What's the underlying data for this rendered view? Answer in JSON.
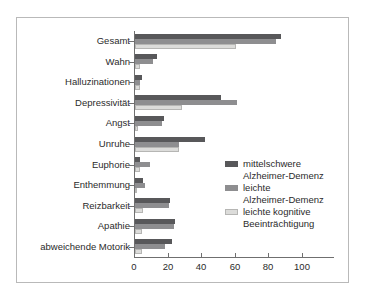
{
  "chart": {
    "type": "bar",
    "orientation": "horizontal",
    "title": "",
    "xlabel": "",
    "ylabel": "",
    "xlim": [
      0,
      118
    ],
    "xticks": [
      "0",
      "20",
      "40",
      "60",
      "80",
      "100"
    ],
    "xtick_values": [
      0,
      20,
      40,
      60,
      80,
      100
    ],
    "grid": false,
    "legend_position": "center-right",
    "colors": {
      "series_0": "#58585a",
      "series_1": "#8e8e90",
      "series_2": "#dcdcda",
      "axis": "#6f6f6f",
      "frame": "#b9b9b9",
      "text": "#2b2b2b",
      "background": "#ffffff"
    }
  },
  "chart_data": {
    "type": "bar",
    "orientation": "horizontal",
    "title": "",
    "xlabel": "",
    "ylabel": "",
    "xlim": [
      0,
      118
    ],
    "grid": false,
    "legend_position": "center-right",
    "categories": [
      "Gesamt",
      "Wahn",
      "Halluzinationen",
      "Depressivität",
      "Angst",
      "Unruhe",
      "Euphorie",
      "Enthemmung",
      "Reizbarkeit",
      "Apathie",
      "abweichende Motorik"
    ],
    "series": [
      {
        "name": "mittelschwere Alzheimer-Demenz",
        "color": "#58585a",
        "values": [
          87,
          13,
          4,
          51,
          17,
          42,
          3,
          5,
          21,
          24,
          22
        ]
      },
      {
        "name": "leichte Alzheimer-Demenz",
        "color": "#8e8e90",
        "values": [
          84,
          11,
          3,
          61,
          16,
          26,
          9,
          6,
          20,
          23,
          18
        ]
      },
      {
        "name": "leichte kognitive Beeinträchtigung",
        "color": "#dcdcda",
        "values": [
          60,
          3,
          3,
          28,
          2,
          26,
          3,
          1,
          5,
          4,
          4
        ]
      }
    ],
    "xticks": [
      0,
      20,
      40,
      60,
      80,
      100
    ]
  },
  "legend": {
    "items": [
      {
        "line1": "mittelschwere",
        "line2": "Alzheimer-Demenz",
        "color": "#58585a"
      },
      {
        "line1": "leichte",
        "line2": "Alzheimer-Demenz",
        "color": "#8e8e90"
      },
      {
        "line1": "leichte kognitive",
        "line2": "Beeinträchtigung",
        "color": "#dcdcda"
      }
    ]
  }
}
